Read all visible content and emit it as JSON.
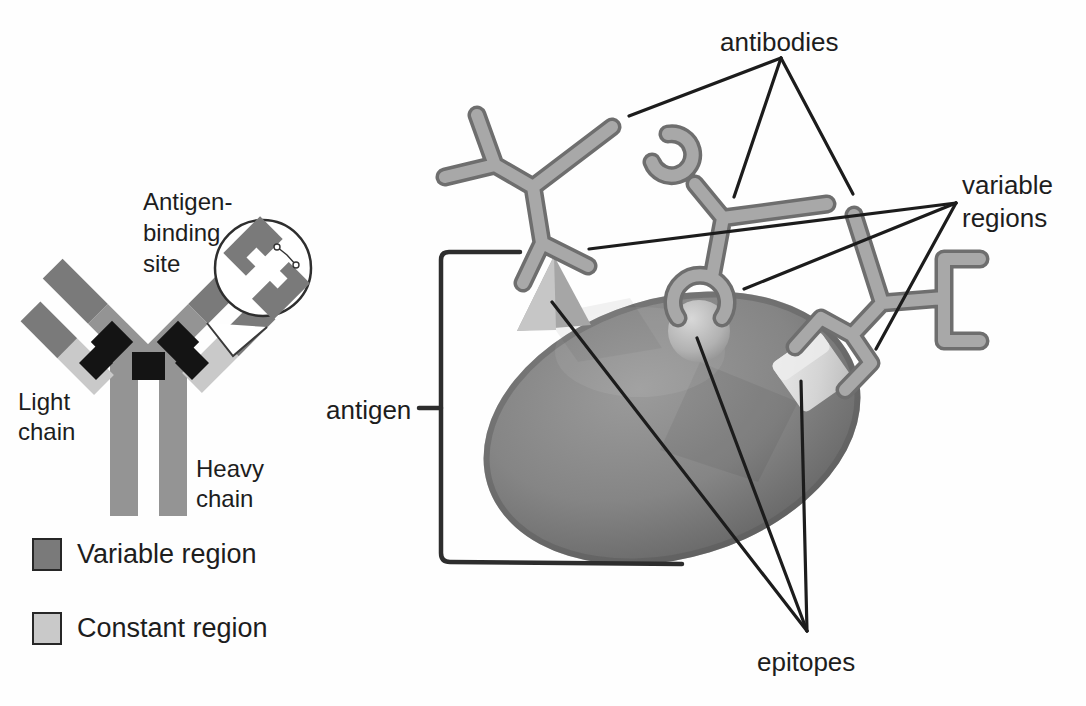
{
  "left_panel": {
    "labels": {
      "antigen_binding_site": [
        "Antigen-",
        "binding",
        "site"
      ],
      "light_chain": [
        "Light",
        "chain"
      ],
      "heavy_chain": [
        "Heavy",
        "chain"
      ]
    },
    "legend": [
      {
        "label": "Variable region",
        "swatch_color": "#7a7a7a"
      },
      {
        "label": "Constant region",
        "swatch_color": "#c9c9c9"
      }
    ]
  },
  "right_panel": {
    "labels": {
      "antibodies": "antibodies",
      "variable_regions": [
        "variable",
        "regions"
      ],
      "antigen": "antigen",
      "epitopes": "epitopes"
    }
  },
  "colors": {
    "background": "#fefefe",
    "text": "#1d1d1d",
    "pointer_line": "#1c1c1c",
    "variable_region": "#7a7a7a",
    "constant_region": "#c9c9c9",
    "heavy_chain": "#949494",
    "hinge": "#141414",
    "antibody_fill": "#a8a8a8",
    "antibody_outline": "#6e6e6e",
    "antigen_body": "#787878",
    "epitope": "#c4c4c4"
  }
}
